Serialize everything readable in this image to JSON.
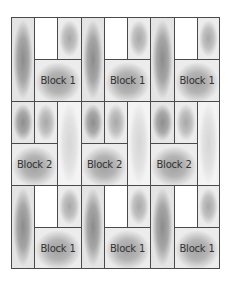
{
  "diagram": {
    "rows": [
      {
        "block_label": "Block 1",
        "pattern": "tall-left"
      },
      {
        "block_label": "Block 2",
        "pattern": "tall-right"
      },
      {
        "block_label": "Block 1",
        "pattern": "tall-left"
      }
    ],
    "labels": {
      "r0b0": "Block 1",
      "r0b1": "Block 1",
      "r0b2": "Block 1",
      "r1b0": "Block 2",
      "r1b1": "Block 2",
      "r1b2": "Block 2",
      "r2b0": "Block 1",
      "r2b1": "Block 1",
      "r2b2": "Block 1"
    },
    "colors": {
      "border": "#4a4a4a",
      "shade_dark": "#8c8c8c",
      "shade_light": "#d6d6d6",
      "text": "#333333"
    }
  }
}
